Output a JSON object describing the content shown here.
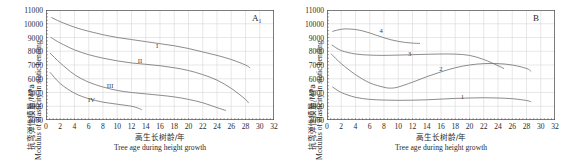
{
  "figure": {
    "width": 562,
    "height": 166,
    "background": "#ffffff",
    "grid_color": "#d8d8d8",
    "axis_color": "#555555",
    "curve_color": "#6e6e6e",
    "text_color": "#2a2a2a"
  },
  "axis_titles": {
    "y_cn": "抗弯弹性模量/MPa",
    "y_en": "Modulus of elasticity in static bending",
    "x_cn": "高生长树龄/年",
    "x_en": "Tree age during height growth"
  },
  "chart_data": [
    {
      "type": "line",
      "title": "A₁",
      "panel_tag": "A₁",
      "xlabel": "Tree age during height growth",
      "ylabel": "Modulus of elasticity in static bending",
      "xlim": [
        0,
        32
      ],
      "ylim": [
        3000,
        11000
      ],
      "xticks": [
        0,
        2,
        4,
        6,
        8,
        10,
        12,
        14,
        16,
        18,
        20,
        22,
        24,
        26,
        28,
        30,
        32
      ],
      "yticks": [
        3000,
        4000,
        5000,
        6000,
        7000,
        8000,
        9000,
        10000,
        11000
      ],
      "grid": true,
      "legend": "inline-labels",
      "series": [
        {
          "name": "I",
          "label_x": 15.6,
          "label_y": 8450,
          "x": [
            0.8,
            2,
            4,
            6,
            8,
            10,
            12,
            14,
            16,
            18,
            20,
            22,
            24,
            26,
            28,
            28.6
          ],
          "y": [
            10450,
            10150,
            9750,
            9450,
            9200,
            9000,
            8850,
            8700,
            8550,
            8400,
            8200,
            7950,
            7700,
            7400,
            7000,
            6800
          ]
        },
        {
          "name": "II",
          "label_x": 13.2,
          "label_y": 7350,
          "x": [
            0.7,
            2,
            4,
            6,
            8,
            10,
            12,
            14,
            16,
            18,
            20,
            22,
            24,
            26,
            28,
            28.4
          ],
          "y": [
            9000,
            8600,
            8100,
            7750,
            7500,
            7300,
            7150,
            7050,
            6950,
            6800,
            6600,
            6300,
            5900,
            5300,
            4500,
            4250
          ]
        },
        {
          "name": "III",
          "label_x": 9.0,
          "label_y": 5550,
          "x": [
            0.6,
            2,
            4,
            6,
            8,
            10,
            12,
            14,
            16,
            18,
            20,
            22,
            24,
            25.2
          ],
          "y": [
            7850,
            7150,
            6300,
            5750,
            5400,
            5150,
            5000,
            4900,
            4800,
            4680,
            4500,
            4250,
            3900,
            3700
          ]
        },
        {
          "name": "IV",
          "label_x": 6.4,
          "label_y": 4500,
          "x": [
            0.6,
            2,
            4,
            6,
            8,
            10,
            12,
            13,
            13.4
          ],
          "y": [
            6450,
            5650,
            4950,
            4550,
            4300,
            4150,
            4000,
            3850,
            3750
          ]
        }
      ]
    },
    {
      "type": "line",
      "title": "B",
      "panel_tag": "B",
      "xlabel": "Tree age during height growth",
      "ylabel": "Modulus of elasticity in static bending",
      "xlim": [
        0,
        32
      ],
      "ylim": [
        3000,
        11000
      ],
      "xticks": [
        0,
        2,
        4,
        6,
        8,
        10,
        12,
        14,
        16,
        18,
        20,
        22,
        24,
        26,
        28,
        30,
        32
      ],
      "yticks": [
        3000,
        4000,
        5000,
        6000,
        7000,
        8000,
        9000,
        10000,
        11000
      ],
      "grid": true,
      "legend": "inline-labels",
      "series": [
        {
          "name": "4",
          "label_x": 7.6,
          "label_y": 9550,
          "x": [
            0.8,
            2,
            3,
            4,
            5,
            6,
            7,
            8,
            9,
            10,
            11,
            12,
            13
          ],
          "y": [
            9450,
            9600,
            9620,
            9580,
            9480,
            9330,
            9150,
            8980,
            8830,
            8720,
            8640,
            8590,
            8570
          ]
        },
        {
          "name": "3",
          "label_x": 11.6,
          "label_y": 7900,
          "x": [
            0.7,
            2,
            4,
            6,
            8,
            10,
            12,
            14,
            16,
            18,
            20,
            22,
            24,
            24.8
          ],
          "y": [
            8450,
            8050,
            7800,
            7720,
            7700,
            7720,
            7750,
            7780,
            7800,
            7790,
            7700,
            7400,
            6950,
            6750
          ]
        },
        {
          "name": "2",
          "label_x": 16.0,
          "label_y": 6780,
          "x": [
            0.6,
            2,
            4,
            6,
            8,
            9,
            10,
            12,
            14,
            16,
            18,
            20,
            22,
            24,
            26,
            28,
            28.6
          ],
          "y": [
            7800,
            7100,
            6300,
            5700,
            5380,
            5320,
            5400,
            5750,
            6150,
            6500,
            6800,
            7000,
            7100,
            7100,
            7000,
            6750,
            6550
          ]
        },
        {
          "name": "1",
          "label_x": 19.0,
          "label_y": 4780,
          "x": [
            0.8,
            2,
            4,
            6,
            8,
            10,
            12,
            14,
            16,
            18,
            20,
            22,
            24,
            26,
            28,
            28.6
          ],
          "y": [
            5400,
            5000,
            4650,
            4500,
            4450,
            4430,
            4440,
            4470,
            4520,
            4570,
            4600,
            4620,
            4600,
            4550,
            4420,
            4330
          ]
        }
      ]
    }
  ]
}
